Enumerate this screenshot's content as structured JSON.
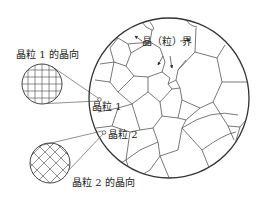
{
  "diagram": {
    "colors": {
      "line": "#333333",
      "boundary": "#555555",
      "background": "#ffffff"
    },
    "labels": {
      "grain1_orientation": "晶粒 1 的晶向",
      "grain2_orientation": "晶粒 2 的晶向",
      "grain_boundary": "晶（粒）界",
      "grain1": "晶粒 1",
      "grain2": "晶粒 2"
    },
    "elements": {
      "main_circle": {
        "cx": 169,
        "cy": 98,
        "r": 80
      },
      "grain1_inset": {
        "cx": 42,
        "cy": 84,
        "r": 20,
        "pattern": "square-grid"
      },
      "grain2_inset": {
        "cx": 50,
        "cy": 163,
        "r": 20,
        "pattern": "diagonal-grid"
      }
    }
  }
}
